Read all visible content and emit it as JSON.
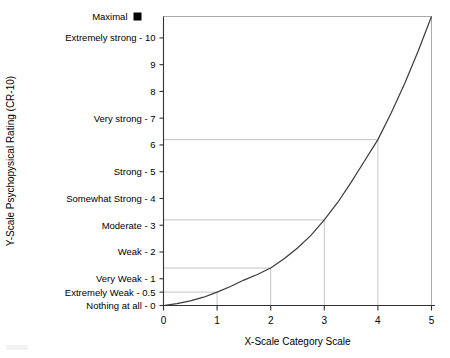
{
  "chart_data": {
    "type": "line",
    "title": "",
    "xlabel": "X-Scale Category Scale",
    "ylabel": "Y-Scale Psychopysical Rating (CR-10)",
    "xlim": [
      0,
      5
    ],
    "ylim": [
      0,
      10.8
    ],
    "grid": false,
    "legend": null,
    "x_ticks": [
      0,
      1,
      2,
      3,
      4,
      5
    ],
    "x_tick_labels": [
      "0",
      "1",
      "2",
      "3",
      "4",
      "5"
    ],
    "y_ticks": [
      0,
      0.5,
      1,
      2,
      3,
      4,
      5,
      6,
      7,
      8,
      9,
      10,
      10.8
    ],
    "y_tick_labels": [
      "Nothing at all - 0",
      "Extremely Weak - 0.5",
      "Very Weak - 1",
      "Weak - 2",
      "Moderate - 3",
      "Somewhat Strong - 4",
      "Strong - 5",
      "6",
      "Very strong - 7",
      "8",
      "9",
      "Extremely strong - 10",
      "Maximal"
    ],
    "series": [
      {
        "name": "CR-10 power function",
        "x": [
          0,
          0.25,
          0.5,
          0.75,
          1,
          1.25,
          1.5,
          1.75,
          2,
          2.25,
          2.5,
          2.75,
          3,
          3.25,
          3.5,
          3.75,
          4,
          4.25,
          4.5,
          4.75,
          5
        ],
        "y": [
          0,
          0.07,
          0.17,
          0.31,
          0.5,
          0.71,
          0.95,
          1.16,
          1.4,
          1.75,
          2.15,
          2.62,
          3.2,
          3.85,
          4.6,
          5.4,
          6.2,
          7.2,
          8.3,
          9.5,
          10.8
        ]
      }
    ],
    "reference_points": [
      {
        "x": 1,
        "y": 0.5
      },
      {
        "x": 2,
        "y": 1.4
      },
      {
        "x": 3,
        "y": 3.2
      },
      {
        "x": 4,
        "y": 6.2
      }
    ],
    "markers": [
      {
        "name": "maximal-marker",
        "shape": "filled-square",
        "color": "#000000",
        "label": "Maximal"
      }
    ],
    "annotations": []
  },
  "colors": {
    "curve": "#3a3a3a",
    "frame": "#aaaaaa",
    "axis": "#333333",
    "gridref": "#bdbdbd",
    "marker": "#000000",
    "background": "#ffffff"
  }
}
